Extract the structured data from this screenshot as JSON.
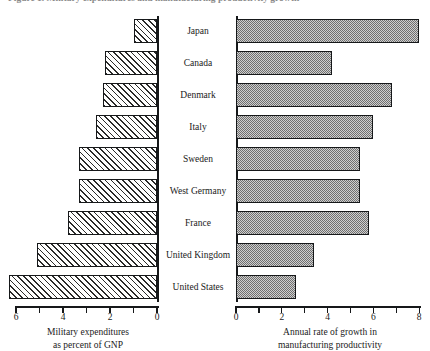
{
  "figure": {
    "title": "Figure 1.  Military expenditures and manufacturing productivity growth"
  },
  "left_axis": {
    "caption_line1": "Military expenditures",
    "caption_line2": "as percent of GNP",
    "ticks": [
      "6",
      "4",
      "2",
      "0"
    ],
    "min": 0,
    "max": 6,
    "reversed": true
  },
  "right_axis": {
    "caption_line1": "Annual rate of growth in",
    "caption_line2": "manufacturing productivity",
    "ticks": [
      "0",
      "2",
      "4",
      "6",
      "8"
    ],
    "min": 0,
    "max": 8,
    "reversed": false
  },
  "chart_data": {
    "type": "bar",
    "title": "Military expenditures and manufacturing productivity growth",
    "orientation": "horizontal",
    "layout": "back-to-back bidirectional (pyramid) bar chart with centered category labels",
    "categories": [
      "Japan",
      "Canada",
      "Denmark",
      "Italy",
      "Sweden",
      "West Germany",
      "France",
      "United Kingdom",
      "United States"
    ],
    "series": [
      {
        "name": "Military expenditures as percent of GNP",
        "side": "left",
        "direction": "right-to-left",
        "xlabel": "Military expenditures as percent of GNP",
        "xlim": [
          0,
          6
        ],
        "ticks": [
          0,
          2,
          4,
          6
        ],
        "values": [
          1.0,
          2.2,
          2.3,
          2.6,
          3.3,
          3.3,
          3.8,
          5.1,
          6.3
        ],
        "fill": "white with black diagonal hatching"
      },
      {
        "name": "Annual rate of growth in manufacturing productivity",
        "side": "right",
        "direction": "left-to-right",
        "xlabel": "Annual rate of growth in manufacturing productivity",
        "xlim": [
          0,
          8
        ],
        "ticks": [
          0,
          2,
          4,
          6,
          8
        ],
        "values": [
          8.0,
          4.2,
          6.8,
          6.0,
          5.4,
          5.4,
          5.8,
          3.4,
          2.6
        ],
        "fill": "gray checkerboard stipple"
      }
    ],
    "grid": false,
    "legend": "none"
  },
  "colors": {
    "ink": "#16181a",
    "hatch": "#2a2a2a",
    "stipple_dark": "#6f6f6f",
    "stipple_light": "#cfcfcf",
    "background": "#ffffff"
  }
}
